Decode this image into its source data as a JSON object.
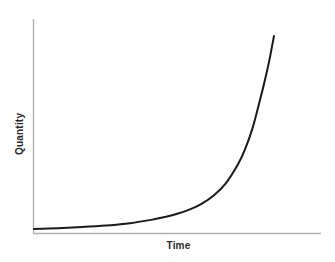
{
  "chart_data": {
    "type": "line",
    "title": "",
    "subtitle": "",
    "xlabel": "Time",
    "ylabel": "Quantity",
    "xlim": [
      0,
      1
    ],
    "ylim": [
      0,
      1
    ],
    "grid": false,
    "legend": null,
    "xticks": [],
    "yticks": [],
    "xticklabels": [],
    "yticklabels": [],
    "annotations": [],
    "series": [
      {
        "name": "exponential growth",
        "color": "#1a1a1a",
        "linewidth": 2,
        "x": [
          0.0,
          0.1,
          0.2,
          0.3,
          0.4,
          0.5,
          0.55,
          0.6,
          0.65,
          0.7,
          0.75,
          0.8,
          0.85,
          0.88,
          0.91,
          0.94,
          0.96,
          0.98,
          0.99,
          1.0
        ],
        "y": [
          0.0,
          0.004,
          0.01,
          0.018,
          0.03,
          0.05,
          0.063,
          0.08,
          0.102,
          0.132,
          0.175,
          0.238,
          0.335,
          0.415,
          0.52,
          0.66,
          0.76,
          0.87,
          0.935,
          1.0
        ]
      }
    ]
  },
  "axes": {
    "x_axis_color": "#b0b0b0",
    "y_axis_color": "#b0b0b0",
    "curve_color": "#1a1a1a",
    "background_color": "#ffffff"
  },
  "labels": {
    "x": "Time",
    "y": "Quantity"
  }
}
